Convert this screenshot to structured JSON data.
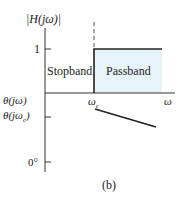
{
  "figure": {
    "panel_label": "(b)",
    "magnitude_plot": {
      "y_label": "|H(jω)|",
      "y_tick_one": "1",
      "stopband_label": "Stopband",
      "passband_label": "Passband",
      "passband_fill": "#e6f4fa",
      "x_label": "ω",
      "cutoff_label": "ω",
      "cutoff_subscript": "c"
    },
    "phase_plot": {
      "y_label": "θ(jω)",
      "y_tick_cutoff": "θ(jω",
      "y_tick_cutoff_sub": "c",
      "y_tick_cutoff_close": ")",
      "y_tick_zero": "0°"
    }
  }
}
